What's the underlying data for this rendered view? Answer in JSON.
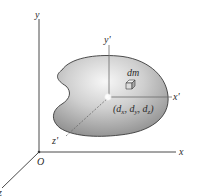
{
  "figure": {
    "colors": {
      "axis": "#4a4a4a",
      "body_light": "#f2f2f2",
      "body_dark": "#8c8c8c",
      "body_outline": "#3a3a3a",
      "text": "#2b2b2b"
    },
    "global_axes": {
      "x_label": "x",
      "y_label": "y",
      "z_label": "z",
      "origin_label": "O"
    },
    "local_axes": {
      "x_label": "x'",
      "y_label": "y'",
      "z_label": "z'"
    },
    "mass_element_label": "dm",
    "offset_point_label": {
      "open": "(",
      "d1": "d",
      "s1": "x",
      "sep1": ", ",
      "d2": "d",
      "s2": "y",
      "sep2": ", ",
      "d3": "d",
      "s3": "z",
      "close": ")"
    }
  }
}
